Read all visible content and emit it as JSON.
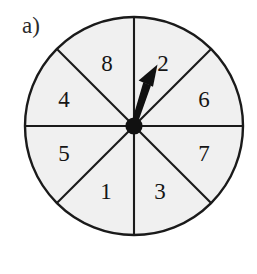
{
  "figure": {
    "panel_label": "a)",
    "type": "spinner-wheel",
    "background_color": "#ffffff",
    "sector_fill_color": "#f0f0f0",
    "line_color": "#1a1a1a",
    "pointer_color": "#111111",
    "circle": {
      "center_x": 134,
      "center_y": 126,
      "radius": 109,
      "stroke_width": 2.2
    },
    "sector_count": 8,
    "sectors": [
      {
        "label": "2",
        "x": 163,
        "y": 63,
        "start_deg": 0,
        "end_deg": 45
      },
      {
        "label": "6",
        "x": 204,
        "y": 99,
        "start_deg": 45,
        "end_deg": 90
      },
      {
        "label": "7",
        "x": 204,
        "y": 153,
        "start_deg": 90,
        "end_deg": 135
      },
      {
        "label": "3",
        "x": 160,
        "y": 191,
        "start_deg": 135,
        "end_deg": 180
      },
      {
        "label": "1",
        "x": 106,
        "y": 191,
        "start_deg": 180,
        "end_deg": 225
      },
      {
        "label": "5",
        "x": 64,
        "y": 153,
        "start_deg": 225,
        "end_deg": 270
      },
      {
        "label": "4",
        "x": 64,
        "y": 99,
        "start_deg": 270,
        "end_deg": 315
      },
      {
        "label": "8",
        "x": 107,
        "y": 63,
        "start_deg": 315,
        "end_deg": 360
      }
    ],
    "pointer": {
      "points_to_sector": "2",
      "tip_x": 157,
      "tip_y": 66,
      "base_x": 134,
      "base_y": 126,
      "hub_radius": 8.5,
      "shaft_width": 6.5,
      "head_length": 26,
      "head_width": 17
    }
  }
}
